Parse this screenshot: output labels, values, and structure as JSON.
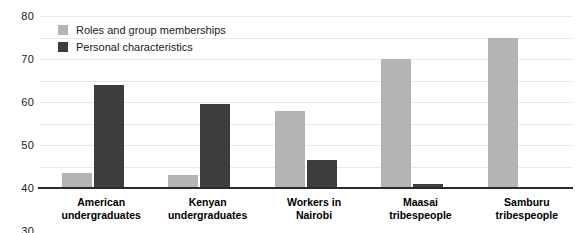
{
  "chart_data": {
    "type": "bar",
    "title": "",
    "xlabel": "",
    "ylabel": "",
    "ylim": [
      0,
      80
    ],
    "yticks": [
      0,
      10,
      20,
      30,
      40,
      50,
      60,
      70,
      80
    ],
    "grid": true,
    "legend_position": "top-left",
    "categories": [
      "American undergraduates",
      "Kenyan undergraduates",
      "Workers in Nairobi",
      "Maasai tribespeople",
      "Samburu tribespeople"
    ],
    "category_lines": [
      [
        "American",
        "undergraduates"
      ],
      [
        "Kenyan",
        "undergraduates"
      ],
      [
        "Workers in",
        "Nairobi"
      ],
      [
        "Maasai",
        "tribespeople"
      ],
      [
        "Samburu",
        "tribespeople"
      ]
    ],
    "series": [
      {
        "name": "Roles and group memberships",
        "color": "#b4b4b4",
        "values": [
          7,
          6,
          36,
          60,
          70
        ]
      },
      {
        "name": "Personal characteristics",
        "color": "#3d3d3d",
        "values": [
          48,
          39,
          13,
          2,
          0
        ]
      }
    ]
  },
  "axis": {
    "tick_labels": [
      "80",
      "70",
      "60",
      "50",
      "40",
      "30",
      "20",
      "10",
      "0"
    ]
  },
  "legend": {
    "items": [
      {
        "label": "Roles and group memberships",
        "color": "#b4b4b4"
      },
      {
        "label": "Personal characteristics",
        "color": "#3d3d3d"
      }
    ]
  }
}
